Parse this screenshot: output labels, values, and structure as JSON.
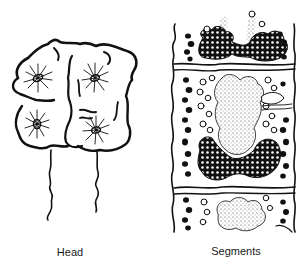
{
  "figure": {
    "panels": [
      {
        "id": "head",
        "label": "Head"
      },
      {
        "id": "segments",
        "label": "Segments"
      }
    ],
    "colors": {
      "ink": "#111111",
      "background": "#ffffff",
      "stipple": "#333333"
    }
  }
}
